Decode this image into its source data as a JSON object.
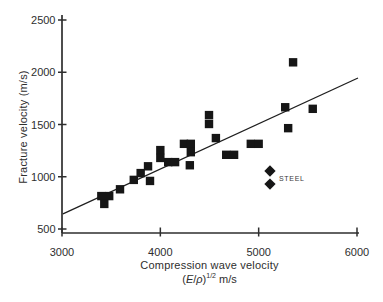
{
  "figure": {
    "background": "#ffffff"
  },
  "chart_data": {
    "type": "scatter",
    "title": "",
    "xlabel": "Compression wave velocity",
    "xlabel_units": {
      "open_paren": "(",
      "e_symbol": "E",
      "slash": "/",
      "rho_symbol": "ρ",
      "close_paren": ")",
      "superscript": "1/2",
      "suffix": " m/s"
    },
    "ylabel": "Fracture velocity (m/s)",
    "xlim": [
      3000,
      6000
    ],
    "ylim": [
      500,
      2500
    ],
    "x_ticks": [
      3000,
      4000,
      5000,
      6000
    ],
    "y_ticks": [
      500,
      1000,
      1500,
      2000,
      2500
    ],
    "grid": false,
    "axis_color": "#2e2e2e",
    "marker_color": "#161616",
    "annotation": {
      "text": "STEEL",
      "attached_to": "steel"
    },
    "series": [
      {
        "name": "materials",
        "marker": "square",
        "points": [
          [
            3400,
            815
          ],
          [
            3480,
            815
          ],
          [
            3430,
            740
          ],
          [
            3590,
            880
          ],
          [
            3730,
            970
          ],
          [
            3800,
            1035
          ],
          [
            3875,
            1100
          ],
          [
            3895,
            960
          ],
          [
            4000,
            1255
          ],
          [
            4000,
            1180
          ],
          [
            4080,
            1140
          ],
          [
            4150,
            1140
          ],
          [
            4240,
            1315
          ],
          [
            4310,
            1315
          ],
          [
            4310,
            1235
          ],
          [
            4300,
            1110
          ],
          [
            4495,
            1590
          ],
          [
            4495,
            1505
          ],
          [
            4565,
            1370
          ],
          [
            4670,
            1210
          ],
          [
            4750,
            1210
          ],
          [
            4920,
            1315
          ],
          [
            5000,
            1315
          ],
          [
            5270,
            1665
          ],
          [
            5300,
            1465
          ],
          [
            5350,
            2095
          ],
          [
            5550,
            1650
          ]
        ]
      },
      {
        "name": "steel",
        "marker": "diamond",
        "points": [
          [
            5115,
            1055
          ],
          [
            5115,
            930
          ]
        ]
      }
    ],
    "trend_line": {
      "x": [
        3010,
        6010
      ],
      "y": [
        645,
        1945
      ]
    }
  }
}
